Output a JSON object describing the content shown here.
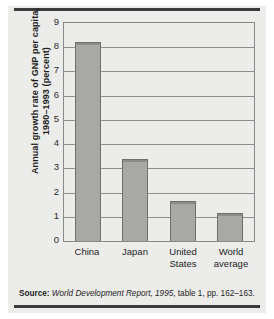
{
  "figure": {
    "y_axis_label_line1": "Annual growth rate of GNP per capita,",
    "y_axis_label_line2": "1980–1993 (percent)",
    "source_label": "Source:",
    "source_italic": "World Development Report, 1995",
    "source_rest": ", table 1, pp. 162–163.",
    "bar_fill_color": "#a8a8a6",
    "bar_edge_color": "#6f6f6e",
    "panel_color": "#ececeb",
    "grid_color": "#8f8f8f",
    "rule_color": "#3b3b3b"
  },
  "chart_data": {
    "type": "bar",
    "title": "",
    "xlabel": "",
    "ylabel": "Annual growth rate of GNP per capita, 1980–1993 (percent)",
    "categories": [
      "China",
      "Japan",
      "United States",
      "World average"
    ],
    "category_lines": [
      [
        "China"
      ],
      [
        "Japan"
      ],
      [
        "United",
        "States"
      ],
      [
        "World",
        "average"
      ]
    ],
    "values": [
      8.2,
      3.4,
      1.65,
      1.15
    ],
    "ylim": [
      0,
      9
    ],
    "yticks": [
      9,
      8,
      7,
      6,
      5,
      4,
      3,
      2,
      1,
      0
    ],
    "ytick_labels": [
      "9",
      "8",
      "7",
      "6",
      "5",
      "4",
      "3",
      "2",
      "1",
      "0"
    ],
    "grid": true,
    "grid_axis": "y",
    "legend": false,
    "legend_position": "none",
    "source": "Source: World Development Report, 1995, table 1, pp. 162–163."
  }
}
